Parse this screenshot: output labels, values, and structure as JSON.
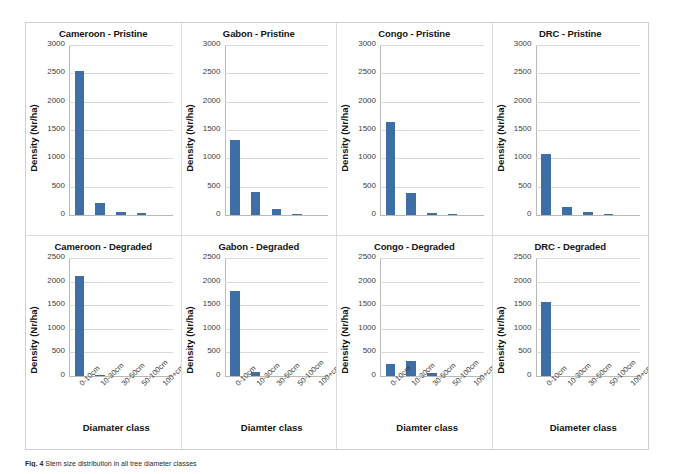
{
  "figure": {
    "caption_label": "Fig. 4",
    "caption_text": "Stem size distribution in all tree diameter classes"
  },
  "axis": {
    "ylabel": "Density (Nr/ha)",
    "xlabel_variants": {
      "diamater": "Diamater class",
      "diamter": "Diamter class",
      "diameter": "Diameter class"
    }
  },
  "style": {
    "bar_color": "#3d6ea5",
    "grid_color": "#d9d9d9",
    "axis_color": "#b9b9b9",
    "panel_border": "#dcdcdc"
  },
  "chart_data": {
    "type": "bar",
    "xlabel": "Diameter class",
    "ylabel": "Density (Nr/ha)",
    "categories": [
      "0-10cm",
      "10-30cm",
      "30-50cm",
      "50-100cm",
      "100+cm"
    ],
    "grid": true,
    "legend": "none",
    "panels": [
      {
        "title": "Cameroon - Pristine",
        "country": "Cameroon",
        "condition": "Pristine",
        "row": 0,
        "col": 0,
        "ylim": [
          0,
          3000
        ],
        "yticks": [
          0,
          500,
          1000,
          1500,
          2000,
          2500,
          3000
        ],
        "ytick_labels": [
          "0",
          "500",
          "1000",
          "1500",
          "2000",
          "2500",
          "3000"
        ],
        "xtick_labels_visible": false,
        "xlabel": "",
        "values": [
          2550,
          205,
          45,
          28,
          0
        ]
      },
      {
        "title": "Gabon - Pristine",
        "country": "Gabon",
        "condition": "Pristine",
        "row": 0,
        "col": 1,
        "ylim": [
          0,
          3000
        ],
        "yticks": [
          0,
          500,
          1000,
          1500,
          2000,
          2500,
          3000
        ],
        "ytick_labels": [
          "0",
          "500",
          "1000",
          "1500",
          "2000",
          "2500",
          "3000"
        ],
        "xtick_labels_visible": false,
        "xlabel": "",
        "values": [
          1330,
          400,
          100,
          22,
          0
        ]
      },
      {
        "title": "Congo - Pristine",
        "country": "Congo",
        "condition": "Pristine",
        "row": 0,
        "col": 2,
        "ylim": [
          0,
          3000
        ],
        "yticks": [
          0,
          500,
          1000,
          1500,
          2000,
          2500,
          3000
        ],
        "ytick_labels": [
          "0",
          "500",
          "1000",
          "1500",
          "2000",
          "2500",
          "3000"
        ],
        "xtick_labels_visible": false,
        "xlabel": "",
        "values": [
          1640,
          390,
          35,
          22,
          0
        ]
      },
      {
        "title": "DRC - Pristine",
        "country": "DRC",
        "condition": "Pristine",
        "row": 0,
        "col": 3,
        "ylim": [
          0,
          3000
        ],
        "yticks": [
          0,
          500,
          1000,
          1500,
          2000,
          2500,
          3000
        ],
        "ytick_labels": [
          "0",
          "500",
          "1000",
          "1500",
          "2000",
          "2500",
          "3000"
        ],
        "xtick_labels_visible": false,
        "xlabel": "",
        "values": [
          1075,
          135,
          55,
          25,
          0
        ]
      },
      {
        "title": "Cameroon - Degraded",
        "country": "Cameroon",
        "condition": "Degraded",
        "row": 1,
        "col": 0,
        "ylim": [
          0,
          2500
        ],
        "yticks": [
          0,
          500,
          1000,
          1500,
          2000,
          2500
        ],
        "ytick_labels": [
          "0",
          "500",
          "1000",
          "1500",
          "2000",
          "2500"
        ],
        "xtick_labels_visible": true,
        "xlabel": "Diamater class",
        "values": [
          2120,
          30,
          0,
          0,
          0
        ]
      },
      {
        "title": "Gabon - Degraded",
        "country": "Gabon",
        "condition": "Degraded",
        "row": 1,
        "col": 1,
        "ylim": [
          0,
          2500
        ],
        "yticks": [
          0,
          500,
          1000,
          1500,
          2000,
          2500
        ],
        "ytick_labels": [
          "0",
          "500",
          "1000",
          "1500",
          "2000",
          "2500"
        ],
        "xtick_labels_visible": true,
        "xlabel": "Diamter class",
        "values": [
          1800,
          80,
          0,
          0,
          0
        ]
      },
      {
        "title": "Congo - Degraded",
        "country": "Congo",
        "condition": "Degraded",
        "row": 1,
        "col": 2,
        "ylim": [
          0,
          2500
        ],
        "yticks": [
          0,
          500,
          1000,
          1500,
          2000,
          2500
        ],
        "ytick_labels": [
          "0",
          "500",
          "1000",
          "1500",
          "2000",
          "2500"
        ],
        "xtick_labels_visible": true,
        "xlabel": "Diamter class",
        "values": [
          250,
          310,
          70,
          0,
          0
        ]
      },
      {
        "title": "DRC - Degraded",
        "country": "DRC",
        "condition": "Degraded",
        "row": 1,
        "col": 3,
        "ylim": [
          0,
          2500
        ],
        "yticks": [
          0,
          500,
          1000,
          1500,
          2000,
          2500
        ],
        "ytick_labels": [
          "0",
          "500",
          "1000",
          "1500",
          "2000",
          "2500"
        ],
        "xtick_labels_visible": true,
        "xlabel": "Diameter class",
        "values": [
          1570,
          0,
          0,
          0,
          0
        ]
      }
    ]
  }
}
